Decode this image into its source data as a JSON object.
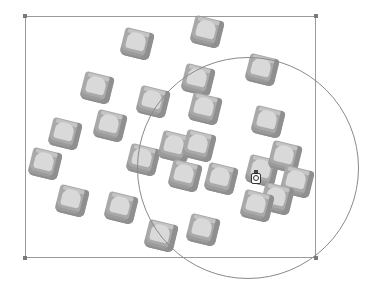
{
  "canvas": {
    "background": "#ffffff",
    "selection_rect": {
      "x": 25,
      "y": 16,
      "width": 291,
      "height": 242,
      "stroke": "#9a9a9a"
    },
    "handles": [
      {
        "name": "top-left",
        "x": 23,
        "y": 14
      },
      {
        "name": "top-right",
        "x": 314,
        "y": 14
      },
      {
        "name": "bottom-left",
        "x": 23,
        "y": 256
      },
      {
        "name": "bottom-right",
        "x": 314,
        "y": 256
      }
    ],
    "circle": {
      "cx": 248,
      "cy": 168,
      "r": 111,
      "stroke": "#8a8a8a"
    },
    "tile_color": "#a9a9a9",
    "tile_face_color": "#d9d9d9",
    "tiles": [
      {
        "x": 122,
        "y": 30,
        "rot": 14
      },
      {
        "x": 192,
        "y": 18,
        "rot": 14
      },
      {
        "x": 82,
        "y": 74,
        "rot": 14
      },
      {
        "x": 138,
        "y": 88,
        "rot": 14
      },
      {
        "x": 183,
        "y": 66,
        "rot": 14
      },
      {
        "x": 247,
        "y": 56,
        "rot": 14
      },
      {
        "x": 50,
        "y": 120,
        "rot": 14
      },
      {
        "x": 95,
        "y": 112,
        "rot": 14
      },
      {
        "x": 190,
        "y": 95,
        "rot": 14
      },
      {
        "x": 253,
        "y": 108,
        "rot": 14
      },
      {
        "x": 30,
        "y": 150,
        "rot": 14
      },
      {
        "x": 128,
        "y": 146,
        "rot": 14
      },
      {
        "x": 160,
        "y": 133,
        "rot": 14
      },
      {
        "x": 184,
        "y": 132,
        "rot": 14
      },
      {
        "x": 170,
        "y": 162,
        "rot": 14
      },
      {
        "x": 206,
        "y": 165,
        "rot": 14
      },
      {
        "x": 247,
        "y": 157,
        "rot": 14
      },
      {
        "x": 270,
        "y": 143,
        "rot": 14
      },
      {
        "x": 282,
        "y": 168,
        "rot": 14
      },
      {
        "x": 262,
        "y": 185,
        "rot": 14
      },
      {
        "x": 242,
        "y": 192,
        "rot": 14
      },
      {
        "x": 57,
        "y": 187,
        "rot": 14
      },
      {
        "x": 106,
        "y": 194,
        "rot": 14
      },
      {
        "x": 146,
        "y": 222,
        "rot": 14
      },
      {
        "x": 188,
        "y": 216,
        "rot": 14
      }
    ],
    "cursor": {
      "x": 251,
      "y": 170,
      "type": "jar-cursor-icon"
    }
  }
}
